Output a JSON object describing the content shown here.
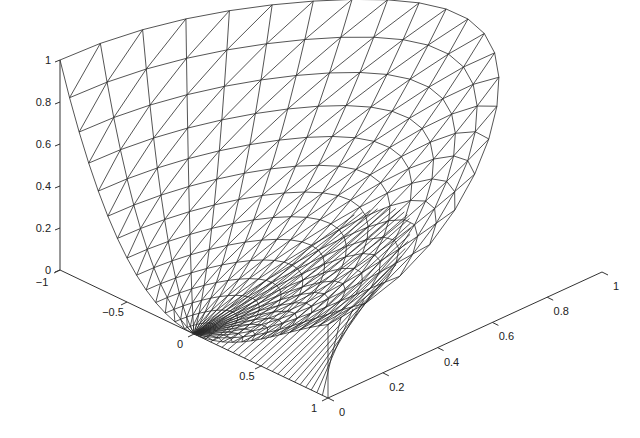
{
  "chart_data": {
    "type": "surface-mesh",
    "title": "",
    "xlabel": "",
    "ylabel": "",
    "zlabel": "",
    "x_axis": {
      "range": [
        -1,
        1
      ],
      "ticks": [
        -1,
        -0.5,
        0,
        0.5,
        1
      ],
      "tick_labels": [
        "−1",
        "−0.5",
        "0",
        "0.5",
        "1"
      ]
    },
    "y_axis": {
      "range": [
        0,
        1
      ],
      "ticks": [
        0,
        0.2,
        0.4,
        0.6,
        0.8,
        1
      ],
      "tick_labels": [
        "0",
        "0.2",
        "0.4",
        "0.6",
        "0.8",
        "1"
      ]
    },
    "z_axis": {
      "range": [
        0,
        1
      ],
      "ticks": [
        0,
        0.2,
        0.4,
        0.6,
        0.8,
        1
      ],
      "tick_labels": [
        "0",
        "0.2",
        "0.4",
        "0.6",
        "0.8",
        "1"
      ]
    },
    "grid": false,
    "legend": null,
    "mesh_color": "#2a2a2a"
  }
}
